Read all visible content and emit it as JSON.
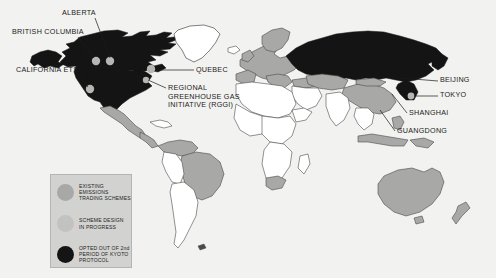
{
  "figure": {
    "type": "world-map",
    "background_color": "#f2f2f0",
    "map_colors": {
      "opted_out_kyoto": "#141414",
      "existing_scheme": "#a8a8a6",
      "scheme_in_progress": "#c2c2c0",
      "no_scheme": "#ffffff",
      "border": "#4a4a4a",
      "marker_dot": "#b6b6b4"
    }
  },
  "annotations": [
    {
      "id": "alberta",
      "label": "ALBERTA",
      "x": 62,
      "y": 13,
      "anchor_x": 108,
      "anchor_y": 60
    },
    {
      "id": "british-columbia",
      "label": "BRITISH COLUMBIA",
      "x": 12,
      "y": 32,
      "anchor_x": 96,
      "anchor_y": 61
    },
    {
      "id": "california-ets",
      "label": "CALIFORNIA ETS",
      "x": 16,
      "y": 70,
      "anchor_x": 90,
      "anchor_y": 89
    },
    {
      "id": "quebec",
      "label": "QUEBEC",
      "x": 196,
      "y": 67,
      "anchor_x": 152,
      "anchor_y": 68
    },
    {
      "id": "rggi",
      "label": "REGIONAL GREENHOUSE GAS INITIATIVE (RGGI)",
      "x": 168,
      "y": 86,
      "anchor_x": 146,
      "anchor_y": 80
    },
    {
      "id": "beijing",
      "label": "BEIJING",
      "x": 440,
      "y": 78,
      "anchor_x": 401,
      "anchor_y": 77
    },
    {
      "id": "tokyo",
      "label": "TOKYO",
      "x": 440,
      "y": 93,
      "anchor_x": 411,
      "anchor_y": 95
    },
    {
      "id": "shanghai",
      "label": "SHANGHAI",
      "x": 409,
      "y": 112,
      "anchor_x": 393,
      "anchor_y": 93
    },
    {
      "id": "guangdong",
      "label": "GUANGDONG",
      "x": 397,
      "y": 130,
      "anchor_x": 381,
      "anchor_y": 108
    }
  ],
  "legend": {
    "items": [
      {
        "id": "existing",
        "swatch_color": "#a8a8a6",
        "line1": "EXISTING EMISSIONS",
        "line2": "TRADING SCHEMES"
      },
      {
        "id": "progress",
        "swatch_color": "#c2c2c0",
        "line1": "SCHEME DESIGN",
        "line2": "IN PROGRESS"
      },
      {
        "id": "opted-out",
        "swatch_color": "#141414",
        "line1": "OPTED OUT OF 2nd",
        "line2": "PERIOD OF KYOTO",
        "line3": "PROTOCOL"
      }
    ]
  },
  "markers": [
    {
      "id": "marker-british-columbia",
      "cx": 96,
      "cy": 61
    },
    {
      "id": "marker-alberta",
      "cx": 110,
      "cy": 61
    },
    {
      "id": "marker-quebec",
      "cx": 151,
      "cy": 69
    },
    {
      "id": "marker-california",
      "cx": 90,
      "cy": 89
    },
    {
      "id": "marker-rggi",
      "cx": 146,
      "cy": 80
    },
    {
      "id": "marker-tokyo",
      "cx": 411,
      "cy": 96
    }
  ]
}
